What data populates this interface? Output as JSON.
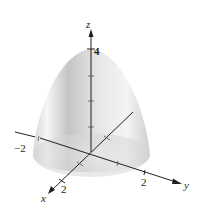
{
  "figure": {
    "type": "3d-surface-plot",
    "surface": "paraboloid opening downward",
    "axes": {
      "x": {
        "label": "x",
        "tick_label": "2"
      },
      "y": {
        "label": "y",
        "tick_labels": [
          "−2",
          "2"
        ]
      },
      "z": {
        "label": "z",
        "tick_label": "4"
      }
    },
    "colors": {
      "surface_light": "#f4f4f4",
      "surface_dark": "#b8b8b8",
      "axis": "#231f20"
    }
  }
}
